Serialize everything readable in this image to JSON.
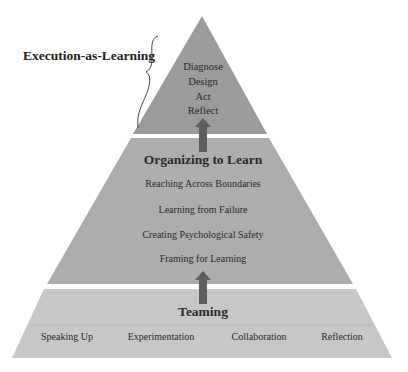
{
  "diagram": {
    "side_label": "Execution-as-Learning",
    "top_tier": {
      "items": [
        "Diagnose",
        "Design",
        "Act",
        "Reflect"
      ]
    },
    "middle_tier": {
      "title": "Organizing to Learn",
      "items": [
        "Reaching Across Boundaries",
        "Learning from Failure",
        "Creating Psychological Safety",
        "Framing for Learning"
      ]
    },
    "bottom_tier": {
      "title": "Teaming",
      "items": [
        "Speaking Up",
        "Experimentation",
        "Collaboration",
        "Reflection"
      ]
    },
    "colors": {
      "top_tier": "#9b9b9b",
      "middle_tier": "#adadad",
      "bottom_tier": "#c7c7c7",
      "arrow": "#5e5e5e",
      "separator": "#ffffff"
    }
  }
}
